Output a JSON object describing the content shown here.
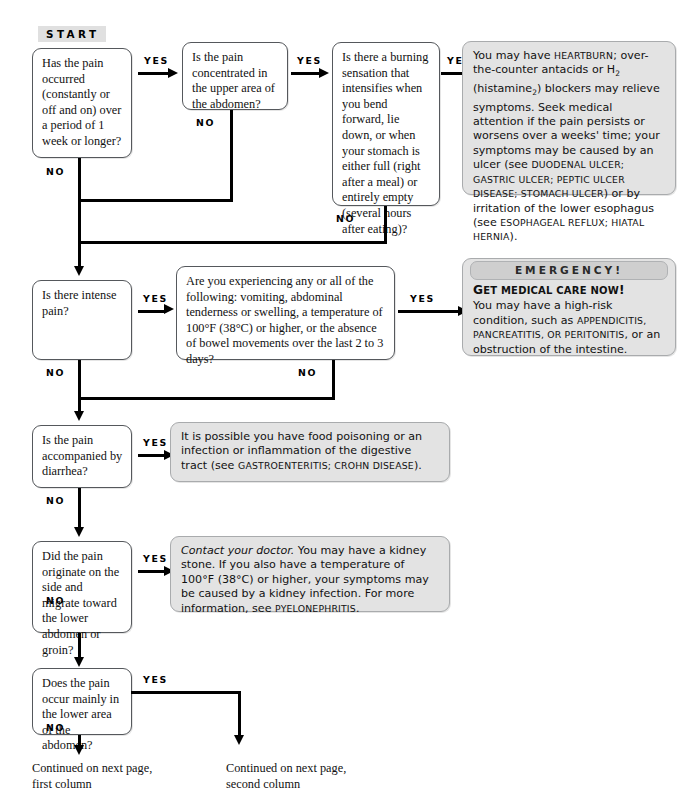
{
  "chart_meta": {
    "title": "Abdominal Pain Diagnostic Flowchart",
    "start_label": "START",
    "yes_label": "YES",
    "no_label": "NO"
  },
  "questions": [
    {
      "id": "q1",
      "text": "Has the pain occurred (constantly or off and on) over a period of 1 week or longer?"
    },
    {
      "id": "q2",
      "text": "Is the pain concentrated in the upper area of the abdomen?"
    },
    {
      "id": "q3",
      "text": "Is there a burning sensation that intensifies when you bend forward, lie down, or when your stomach is either full (right after a meal) or entirely empty (several hours after eating)?"
    },
    {
      "id": "q4",
      "text": "Is there intense pain?"
    },
    {
      "id": "q5",
      "text": "Are you experiencing any or all of the following: vomiting, abdominal tenderness or swelling, a temperature of 100°F (38°C) or higher, or the absence of bowel movements over the last 2 to 3 days?"
    },
    {
      "id": "q6",
      "text": "Is the pain accompanied by diarrhea?"
    },
    {
      "id": "q7",
      "text": "Did the pain originate on the side and migrate toward the lower abdomen or groin?"
    },
    {
      "id": "q8",
      "text": "Does the pain occur mainly in the lower area of the abdomen?"
    }
  ],
  "answers": {
    "heartburn": {
      "p1_a": "You may have ",
      "p1_sc1": "heartburn",
      "p1_b": "; over-the-counter antacids or H",
      "p1_sub": "2",
      "p1_c": " (histamine",
      "p1_sub2": "2",
      "p1_d": ") blockers may relieve symptoms. Seek medical attention if the pain persists or worsens over a weeks' time; your symptoms may be caused by an ulcer (see ",
      "p1_sc2": "duodenal ulcer; gastric ulcer; peptic ulcer disease; stomach ulcer",
      "p1_e": ") or by irritation of the lower esophagus (see ",
      "p1_sc3": "esophageal reflux; hiatal hernia",
      "p1_f": ")."
    },
    "emergency": {
      "banner": "EMERGENCY!",
      "heading_first": "G",
      "heading_rest": "et medical care now",
      "heading_bang": "!",
      "body_a": "You may have a high-risk condition, such as ",
      "body_sc": "appendicitis, pancreatitis, or peritonitis",
      "body_b": ", or an obstruction of the intestine."
    },
    "food_poisoning": {
      "body_a": "It is possible you have food poisoning or an infection or inflammation of the digestive tract (see ",
      "body_sc": "gastroenteritis; Crohn disease",
      "body_b": ")."
    },
    "kidney_stone": {
      "italic": "Contact your doctor.",
      "body_a": " You may have a kidney stone. If you also have a temperature of 100°F (38°C) or higher, your symptoms may be caused by a kidney infection. For more information, see ",
      "body_sc": "pyelonephritis",
      "body_b": "."
    }
  },
  "footers": [
    {
      "id": "f1",
      "text": "Continued on next page,\nfirst column"
    },
    {
      "id": "f2",
      "text": "Continued on next page,\nsecond column"
    }
  ],
  "colors": {
    "answer_box_bg": "#e3e3e3",
    "question_box_bg": "#ffffff",
    "banner_bg": "#cfcfcf",
    "start_bg": "#e0e0e0",
    "line": "#000000"
  }
}
